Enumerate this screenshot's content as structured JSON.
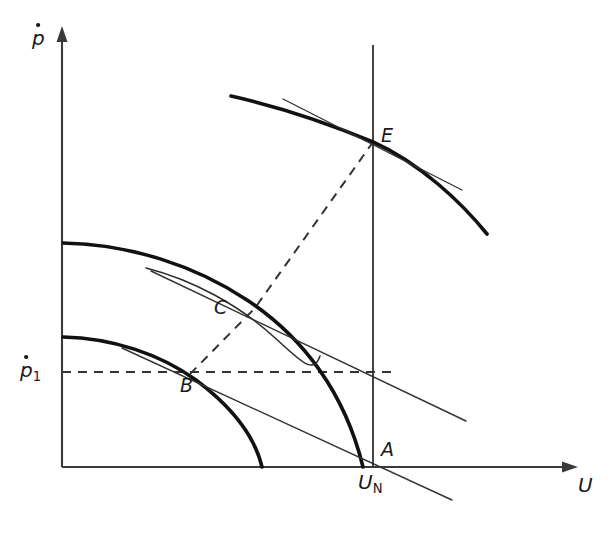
{
  "figure": {
    "background_color": "#ffffff",
    "width": 613,
    "height": 541
  },
  "axes": {
    "y_axis": {
      "name": "y-axis",
      "label_base": "p",
      "label_full": "p-dot",
      "has_arrow": true,
      "x": 62,
      "top": 30,
      "bottom": 467
    },
    "x_axis": {
      "name": "x-axis",
      "label": "U",
      "has_arrow": true,
      "y": 467,
      "left": 62,
      "right": 578
    },
    "y_tick": {
      "label_base": "p",
      "subscript": "1",
      "value_y": 372
    },
    "x_tick": {
      "label_base": "U",
      "subscript": "N",
      "value_x": 373
    }
  },
  "vertical_reference_line": {
    "name": "nominal-voltage-line",
    "x": 373,
    "y_top": 45,
    "y_bottom": 467
  },
  "horizontal_reference_line": {
    "name": "p1-level-dashed-line",
    "y": 372,
    "x_start": 62,
    "x_end": 392,
    "style": "dashed"
  },
  "operating_path": {
    "name": "load-transfer-dashed-path",
    "style": "dashed",
    "points": [
      "B",
      "C",
      "E"
    ]
  },
  "points": [
    {
      "id": "E",
      "label": "E",
      "x": 373,
      "y": 142,
      "label_x": 381,
      "label_y": 126
    },
    {
      "id": "C",
      "label": "C",
      "x": 255,
      "y": 308,
      "label_x": 214,
      "label_y": 298
    },
    {
      "id": "B",
      "label": "B",
      "x": 192,
      "y": 372,
      "label_x": 180,
      "label_y": 376
    },
    {
      "id": "A",
      "label": "A",
      "x": 373,
      "y": 467,
      "label_x": 381,
      "label_y": 440
    }
  ],
  "curves": [
    {
      "id": "curve-top",
      "name": "upper-characteristic-curve",
      "passes_through": "E"
    },
    {
      "id": "curve-middle",
      "name": "middle-characteristic-curve",
      "passes_through": "C"
    },
    {
      "id": "curve-lower",
      "name": "lower-characteristic-curve",
      "passes_through": "B"
    },
    {
      "id": "curve-inner",
      "name": "inner-characteristic-curve",
      "passes_through": ""
    }
  ],
  "tangents": [
    {
      "id": "tangent-E",
      "name": "tangent-at-E"
    },
    {
      "id": "tangent-C",
      "name": "tangent-at-C"
    },
    {
      "id": "tangent-B",
      "name": "tangent-at-B"
    }
  ],
  "colors": {
    "curve": "#111111",
    "axis": "#3a3a3a",
    "tangent": "#333333",
    "dashed": "#333333",
    "text": "#1a1a1a"
  }
}
